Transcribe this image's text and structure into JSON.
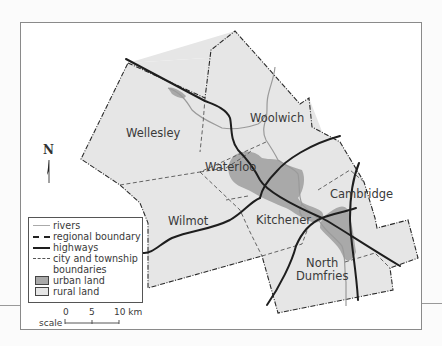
{
  "caption_fragment": "Waterloo Region: municipal boundaries, urban land and highways",
  "map": {
    "municipalities": [
      {
        "id": "wellesley",
        "label": "Wellesley"
      },
      {
        "id": "woolwich",
        "label": "Woolwich"
      },
      {
        "id": "waterloo",
        "label": "Waterloo"
      },
      {
        "id": "wilmot",
        "label": "Wilmot"
      },
      {
        "id": "kitchener",
        "label": "Kitchener"
      },
      {
        "id": "cambridge",
        "label": "Cambridge"
      },
      {
        "id": "north_dumfries",
        "label_line1": "North",
        "label_line2": "Dumfries"
      }
    ],
    "north_arrow": "N",
    "colors": {
      "rural_land": "#e6e6e6",
      "urban_land": "#a9a9a9",
      "rivers": "#9a9a9a",
      "highways": "#1e1e1e",
      "regional_boundary": "#2a2a2a",
      "city_boundaries": "#555555"
    }
  },
  "legend": {
    "items": [
      {
        "symbol": "rivers-line",
        "label": "rivers"
      },
      {
        "symbol": "regional-boundary-line",
        "label": "regional boundary"
      },
      {
        "symbol": "highways-line",
        "label": "highways"
      },
      {
        "symbol": "city-boundary-line",
        "label_line1": "city and township",
        "label_line2": "boundaries"
      },
      {
        "symbol": "urban-swatch",
        "label": "urban land"
      },
      {
        "symbol": "rural-swatch",
        "label": "rural land"
      }
    ]
  },
  "scale": {
    "word": "scale",
    "ticks": [
      "0",
      "5",
      "10 km"
    ]
  }
}
